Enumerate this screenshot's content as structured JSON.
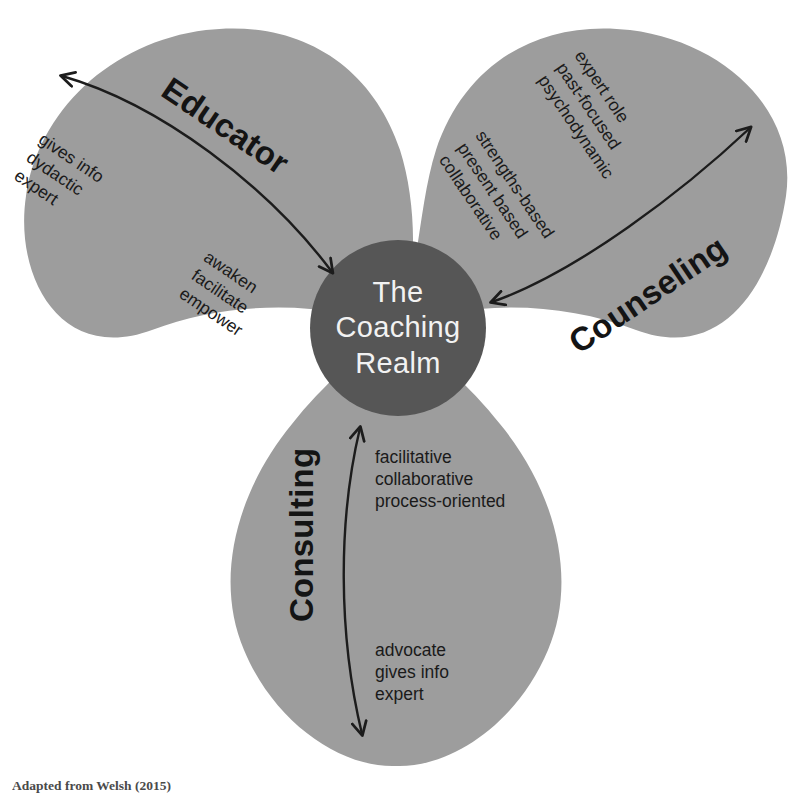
{
  "figure": {
    "title": "The Coaching Realm",
    "type": "three-petal venn / trefoil concept diagram",
    "caption": "Adapted from Welsh (2015)"
  },
  "center": {
    "name": "The Coaching Realm",
    "lines": [
      "The",
      "Coaching",
      "Realm"
    ],
    "fill_color": "#565656",
    "text_color": "#f2f2f2"
  },
  "colors": {
    "petal_fill": "#9d9d9d",
    "center_fill": "#565656",
    "arrow_stroke": "#1c1c1c",
    "background": "#ffffff",
    "petal_text": "#141414",
    "center_text": "#f2f2f2"
  },
  "petals": [
    {
      "id": "educator",
      "label": "Educator",
      "position": "top-left",
      "arrow": {
        "style": "double-headed curved arc",
        "direction": "outward/inward"
      },
      "attributes_outward": [
        "gives info",
        "dydactic",
        "expert"
      ],
      "attributes_inward": [
        "awaken",
        "facilitate",
        "empower"
      ]
    },
    {
      "id": "counseling",
      "label": "Counseling",
      "position": "top-right",
      "arrow": {
        "style": "double-headed curved arc",
        "direction": "outward/inward"
      },
      "attributes_outward": [
        "expert role",
        "past-focused",
        "psychodynamic"
      ],
      "attributes_inward": [
        "strengths-based",
        "present based",
        "collaborative"
      ]
    },
    {
      "id": "consulting",
      "label": "Consulting",
      "position": "bottom",
      "arrow": {
        "style": "double-headed curved arc",
        "direction": "outward/inward"
      },
      "attributes_inward": [
        "facilitative",
        "collaborative",
        "process-oriented"
      ],
      "attributes_outward": [
        "advocate",
        "gives info",
        "expert"
      ]
    }
  ]
}
